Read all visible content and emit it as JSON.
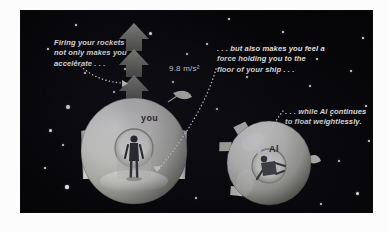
{
  "figure": {
    "kind": "space-illustration",
    "background_color": "#050507",
    "paper_color": "#fcfcfc",
    "text_color": "#f2f2f2"
  },
  "captions": {
    "left": "Firing your rockets\nnot only makes you\naccelerate . . .",
    "middle": ". . . but also makes you feel a\nforce holding you to the\nfloor of your ship . . .",
    "right": ". . . while Al continues\nto float weightlessly."
  },
  "acceleration": {
    "label": "9.8 m/s²",
    "arrow_direction": "up"
  },
  "ships": [
    {
      "id": "left-ship",
      "label": "you",
      "state": "accelerating",
      "has_rockets": true
    },
    {
      "id": "right-ship",
      "label": "Al",
      "state": "weightless",
      "has_rockets": false
    }
  ],
  "stars": [
    {
      "x": 27,
      "y": 38,
      "r": 1.1
    },
    {
      "x": 47,
      "y": 96,
      "r": 2.2
    },
    {
      "x": 29,
      "y": 119,
      "r": 1.5
    },
    {
      "x": 42,
      "y": 134,
      "r": 1.3
    },
    {
      "x": 46,
      "y": 176,
      "r": 1.6
    },
    {
      "x": 24,
      "y": 157,
      "r": 1.0
    },
    {
      "x": 64,
      "y": 62,
      "r": 1.0
    },
    {
      "x": 93,
      "y": 81,
      "r": 1.3
    },
    {
      "x": 104,
      "y": 58,
      "r": 1.0
    },
    {
      "x": 129,
      "y": 22,
      "r": 1.5
    },
    {
      "x": 152,
      "y": 71,
      "r": 1.2
    },
    {
      "x": 166,
      "y": 43,
      "r": 1.2
    },
    {
      "x": 160,
      "y": 123,
      "r": 1.4
    },
    {
      "x": 117,
      "y": 186,
      "r": 1.5
    },
    {
      "x": 175,
      "y": 187,
      "r": 1.2
    },
    {
      "x": 186,
      "y": 33,
      "r": 1.4
    },
    {
      "x": 196,
      "y": 98,
      "r": 1.0
    },
    {
      "x": 211,
      "y": 140,
      "r": 1.0
    },
    {
      "x": 226,
      "y": 66,
      "r": 1.2
    },
    {
      "x": 235,
      "y": 117,
      "r": 1.1
    },
    {
      "x": 243,
      "y": 183,
      "r": 1.5
    },
    {
      "x": 262,
      "y": 21,
      "r": 1.0
    },
    {
      "x": 289,
      "y": 75,
      "r": 1.4
    },
    {
      "x": 296,
      "y": 48,
      "r": 1.2
    },
    {
      "x": 310,
      "y": 104,
      "r": 1.3
    },
    {
      "x": 330,
      "y": 60,
      "r": 1.3
    },
    {
      "x": 342,
      "y": 27,
      "r": 1.1
    },
    {
      "x": 318,
      "y": 150,
      "r": 1.2
    },
    {
      "x": 336,
      "y": 182,
      "r": 1.5
    },
    {
      "x": 300,
      "y": 193,
      "r": 1.2
    },
    {
      "x": 270,
      "y": 166,
      "r": 1.0
    },
    {
      "x": 208,
      "y": 8,
      "r": 1.0
    },
    {
      "x": 55,
      "y": 14,
      "r": 0.9
    },
    {
      "x": 348,
      "y": 130,
      "r": 1.0
    },
    {
      "x": 76,
      "y": 110,
      "r": 0.9
    },
    {
      "x": 345,
      "y": 95,
      "r": 1.0
    }
  ],
  "leaders": [
    {
      "id": "leader-accelerate",
      "from": "caption-left",
      "to": "acceleration-arrow"
    },
    {
      "id": "leader-force",
      "from": "caption-mid",
      "to": "left-ship-floor"
    },
    {
      "id": "leader-float",
      "from": "caption-right",
      "to": "right-ship-interior"
    }
  ]
}
